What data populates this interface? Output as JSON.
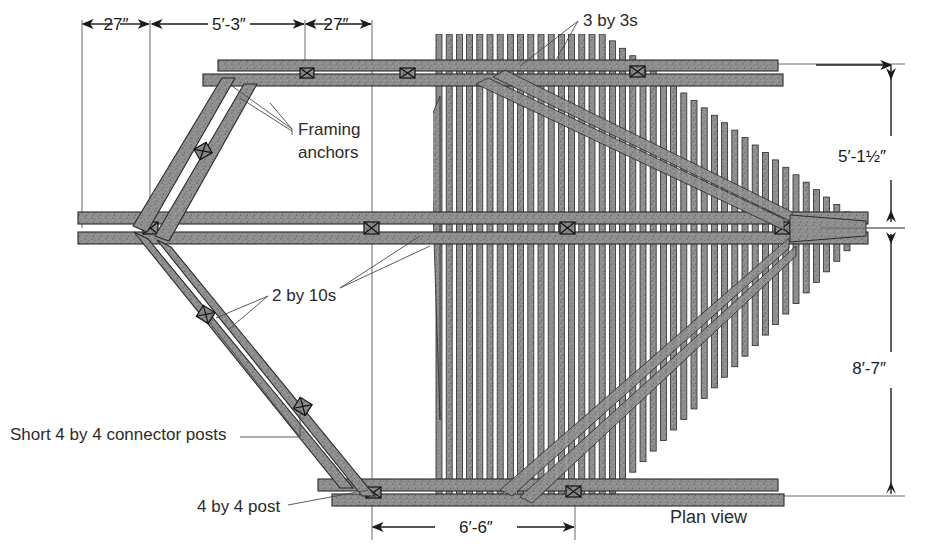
{
  "drawing": {
    "title": "Plan view",
    "view_label": "Plan view"
  },
  "dimensions": {
    "top": [
      {
        "id": "dim-27-left",
        "text": "27″"
      },
      {
        "id": "dim-5-3",
        "text": "5′-3″"
      },
      {
        "id": "dim-27-right",
        "text": "27″"
      }
    ],
    "right": [
      {
        "id": "dim-5-1half",
        "text": "5′-1½″"
      },
      {
        "id": "dim-8-7",
        "text": "8′-7″"
      }
    ],
    "bottom": [
      {
        "id": "dim-6-6",
        "text": "6′-6″"
      }
    ]
  },
  "annotations": [
    {
      "id": "anno-framing-anchors",
      "line1": "Framing",
      "line2": "anchors"
    },
    {
      "id": "anno-3-by-3s",
      "line1": "3 by 3s",
      "line2": ""
    },
    {
      "id": "anno-2-by-10s",
      "line1": "2 by 10s",
      "line2": ""
    },
    {
      "id": "anno-connector-posts",
      "line1": "Short 4 by 4 connector posts",
      "line2": ""
    },
    {
      "id": "anno-4-by-4-post",
      "line1": "4 by 4 post",
      "line2": ""
    }
  ],
  "colors": {
    "wood_fill": "#8d8d8d",
    "wood_stroke": "#2a2a2a",
    "line": "#2a2a2a",
    "thin_line": "#555555",
    "text": "#2b2b2b",
    "background": "#ffffff"
  },
  "geometry": {
    "note": "plan view of a fan-shaped deck overhead: parallel 2 by 10 beams, fanned 3 by 3 slats converging to a point at right"
  }
}
